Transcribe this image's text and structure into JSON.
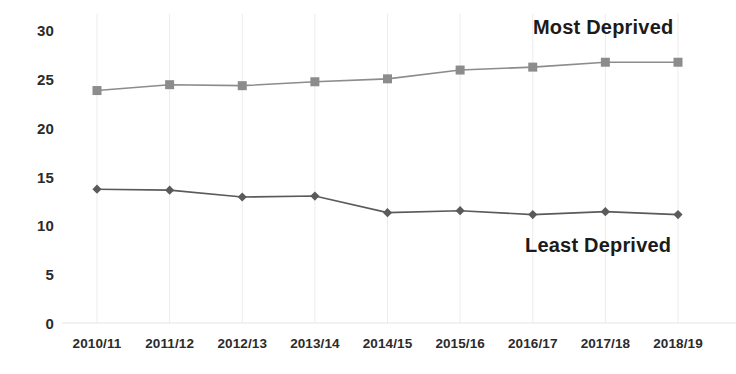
{
  "chart_data": {
    "type": "line",
    "title": "",
    "xlabel": "",
    "ylabel": "",
    "ylim": [
      0,
      30
    ],
    "yticks": [
      0,
      5,
      10,
      15,
      20,
      25,
      30
    ],
    "ytick_labels": [
      "0",
      "5",
      "10",
      "15",
      "20",
      "25",
      "30"
    ],
    "grid": "vertical",
    "legend_position": "inline-annotations",
    "categories": [
      "2010/11",
      "2011/12",
      "2012/13",
      "2013/14",
      "2014/15",
      "2015/16",
      "2016/17",
      "2017/18",
      "2018/19"
    ],
    "series": [
      {
        "name": "Most Deprived",
        "marker": "square",
        "color": "#8c8c8c",
        "values": [
          23.8,
          24.4,
          24.3,
          24.7,
          25.0,
          25.9,
          26.2,
          26.7,
          26.7
        ]
      },
      {
        "name": "Least Deprived",
        "marker": "diamond",
        "color": "#5a5a5a",
        "values": [
          13.7,
          13.6,
          12.9,
          13.0,
          11.3,
          11.5,
          11.1,
          11.4,
          11.1
        ]
      }
    ],
    "annotations": [
      {
        "text": "Most Deprived",
        "series": "Most Deprived"
      },
      {
        "text": "Least Deprived",
        "series": "Least Deprived"
      }
    ]
  },
  "colors": {
    "most_deprived": "#8c8c8c",
    "least_deprived": "#5a5a5a",
    "gridline": "#ececec",
    "text": "#2b2b2b",
    "background": "#ffffff"
  }
}
